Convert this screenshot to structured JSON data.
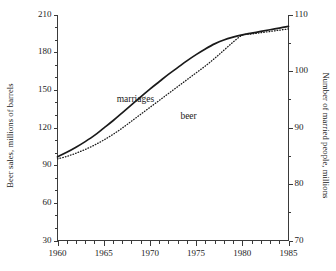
{
  "chart_data": {
    "type": "line",
    "title": "",
    "xlabel": "",
    "ylabel": "Beer sales, millions of barrels",
    "y2label": "Number of married people, millions",
    "xlim": [
      1960,
      1985
    ],
    "ylim": [
      30,
      210
    ],
    "y2lim": [
      70,
      110
    ],
    "grid": false,
    "legend_position": "inline-annotations",
    "xticks": [
      1960,
      1965,
      1970,
      1975,
      1980,
      1985
    ],
    "xtick_labels": [
      "1960",
      "1965",
      "1970",
      "1975",
      "1980",
      "1985"
    ],
    "xminor_step": 1,
    "yticks": [
      30,
      60,
      90,
      120,
      150,
      180,
      210
    ],
    "ytick_labels": [
      "30",
      "60",
      "90",
      "120",
      "150",
      "180",
      "210"
    ],
    "yminor_step": 10,
    "y2ticks": [
      70,
      80,
      90,
      100,
      110
    ],
    "y2tick_labels": [
      "70",
      "80",
      "90",
      "100",
      "110"
    ],
    "y2minor_step": 5,
    "x": [
      1960,
      1961,
      1962,
      1963,
      1964,
      1965,
      1966,
      1967,
      1968,
      1969,
      1970,
      1971,
      1972,
      1973,
      1974,
      1975,
      1976,
      1977,
      1978,
      1979,
      1980,
      1981,
      1982,
      1983,
      1984,
      1985
    ],
    "series": [
      {
        "name": "marriages",
        "axis": "right",
        "style": "solid",
        "color": "#1a1a1a",
        "values": [
          84.8,
          85.6,
          86.5,
          87.5,
          88.6,
          89.9,
          91.2,
          92.6,
          94.0,
          95.4,
          96.8,
          98.1,
          99.4,
          100.6,
          101.8,
          102.9,
          103.9,
          104.8,
          105.5,
          106.0,
          106.4,
          106.7,
          107.0,
          107.3,
          107.6,
          107.9
        ]
      },
      {
        "name": "beer",
        "axis": "left",
        "style": "dotted",
        "color": "#1a1a1a",
        "values": [
          95.0,
          97.0,
          99.5,
          102.5,
          106.0,
          110.0,
          114.5,
          119.5,
          125.0,
          130.5,
          136.0,
          141.5,
          147.0,
          152.5,
          158.0,
          163.5,
          169.0,
          175.0,
          181.5,
          188.0,
          193.5,
          194.5,
          195.5,
          196.5,
          197.5,
          198.5
        ]
      }
    ],
    "annotations": [
      {
        "text": "marriages",
        "x": 1966.4,
        "y_px": 94
      },
      {
        "text": "beer",
        "x": 1973.3,
        "y_px": 111
      }
    ]
  },
  "colors": {
    "axis": "#3a3a3a",
    "ink": "#1a1a1a",
    "background": "#ffffff"
  }
}
